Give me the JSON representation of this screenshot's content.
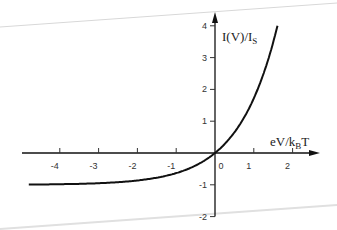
{
  "chart_data": {
    "type": "line",
    "title": "",
    "xlabel": "eV/k_BT",
    "ylabel": "I(V)/I_S",
    "xlabel_main": "eV/k",
    "xlabel_sub": "B",
    "xlabel_tail": "T",
    "ylabel_main": "I(V)/I",
    "ylabel_sub": "S",
    "xlim": [
      -4.8,
      2.5
    ],
    "ylim": [
      -2,
      4
    ],
    "x_ticks": [
      -4,
      -3,
      -2,
      -1,
      0,
      1,
      2
    ],
    "x_tick_labels": [
      "-4",
      "-3",
      "-2",
      "-1",
      "0",
      "1",
      "2"
    ],
    "y_ticks": [
      -2,
      -1,
      1,
      2,
      3,
      4
    ],
    "y_tick_labels": [
      "-2",
      "-1",
      "1",
      "2",
      "3",
      "4"
    ],
    "grid": false,
    "legend": null,
    "series": [
      {
        "name": "I(V)/I_S = exp(eV/k_BT) - 1",
        "x": [
          -4.8,
          -4,
          -3,
          -2,
          -1.5,
          -1,
          -0.5,
          0,
          0.25,
          0.5,
          0.75,
          1,
          1.25,
          1.5,
          1.61
        ],
        "y": [
          -0.99,
          -0.98,
          -0.95,
          -0.86,
          -0.78,
          -0.63,
          -0.39,
          0,
          0.28,
          0.65,
          1.12,
          1.72,
          2.49,
          3.48,
          4.0
        ]
      }
    ]
  }
}
